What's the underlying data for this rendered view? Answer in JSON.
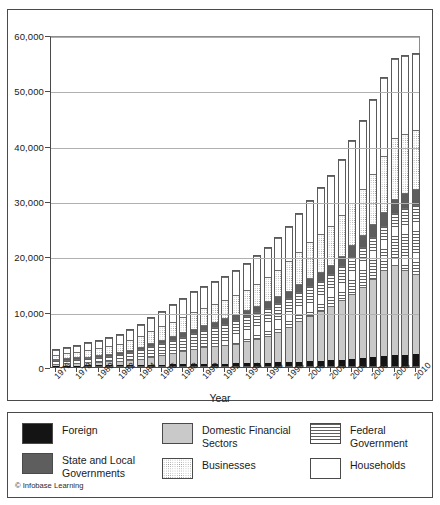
{
  "figure": {
    "credit": "© Infobase Learning"
  },
  "chart_data": {
    "type": "bar",
    "subtype": "stacked",
    "title": "",
    "xlabel": "Year",
    "ylabel": "",
    "ylim": [
      0,
      60000
    ],
    "yticks": [
      0,
      10000,
      20000,
      30000,
      40000,
      50000,
      60000
    ],
    "ytick_labels": [
      "0",
      "10,000",
      "20,000",
      "30,000",
      "40,000",
      "50,000",
      "60,000"
    ],
    "grid": true,
    "legend_position": "below",
    "categories": [
      1976,
      1977,
      1978,
      1979,
      1980,
      1981,
      1982,
      1983,
      1984,
      1985,
      1986,
      1987,
      1988,
      1989,
      1990,
      1991,
      1992,
      1993,
      1994,
      1995,
      1996,
      1997,
      1998,
      1999,
      2000,
      2001,
      2002,
      2003,
      2004,
      2005,
      2006,
      2007,
      2008,
      2009,
      2010
    ],
    "xtick_labels": [
      "1976",
      "1978",
      "1980",
      "1982",
      "1984",
      "1986",
      "1988",
      "1990",
      "1992",
      "1994",
      "1996",
      "1998",
      "2000",
      "2002",
      "2004",
      "2006",
      "2008",
      "2010"
    ],
    "stack_order_bottom_to_top": [
      "Foreign",
      "Domestic Financial Sectors",
      "Federal Government",
      "State and Local Governments",
      "Businesses",
      "Households"
    ],
    "series": [
      {
        "name": "Foreign",
        "fill": "solid-black",
        "color": "#141414",
        "values": [
          60,
          70,
          85,
          95,
          110,
          125,
          140,
          160,
          185,
          215,
          250,
          285,
          320,
          350,
          380,
          405,
          430,
          460,
          500,
          545,
          600,
          665,
          730,
          800,
          880,
          960,
          1050,
          1160,
          1290,
          1430,
          1600,
          1780,
          1940,
          2020,
          2090
        ]
      },
      {
        "name": "Domestic Financial Sectors",
        "fill": "solid-light-gray",
        "color": "#c9c9c9",
        "values": [
          340,
          400,
          470,
          545,
          625,
          710,
          800,
          940,
          1120,
          1380,
          1700,
          2050,
          2400,
          2750,
          3050,
          3200,
          3350,
          3600,
          3950,
          4400,
          4900,
          5550,
          6400,
          7350,
          8250,
          9050,
          9800,
          10700,
          11800,
          12900,
          14200,
          15600,
          16300,
          15400,
          14600
        ]
      },
      {
        "name": "Federal Government",
        "fill": "horizontal-lines",
        "color": "#ffffff",
        "values": [
          620,
          680,
          730,
          780,
          900,
          1000,
          1200,
          1450,
          1700,
          1950,
          2200,
          2400,
          2600,
          2800,
          3050,
          3450,
          3900,
          4250,
          4550,
          4800,
          5000,
          5150,
          5200,
          5250,
          5300,
          5400,
          5700,
          6200,
          6700,
          7100,
          7500,
          7900,
          9400,
          11200,
          12500
        ]
      },
      {
        "name": "State and Local Governments",
        "fill": "solid-dark-gray",
        "color": "#5e5e5e",
        "values": [
          240,
          260,
          280,
          300,
          320,
          340,
          370,
          420,
          480,
          560,
          640,
          700,
          760,
          820,
          880,
          930,
          980,
          1030,
          1080,
          1130,
          1190,
          1250,
          1320,
          1400,
          1480,
          1600,
          1750,
          1900,
          2050,
          2200,
          2350,
          2500,
          2600,
          2700,
          2800
        ]
      },
      {
        "name": "Businesses",
        "fill": "dotted",
        "color": "#ffffff",
        "values": [
          780,
          880,
          1000,
          1130,
          1270,
          1400,
          1520,
          1680,
          1900,
          2150,
          2400,
          2620,
          2850,
          3050,
          3200,
          3250,
          3300,
          3450,
          3700,
          4000,
          4350,
          4750,
          5300,
          5900,
          6500,
          6900,
          7100,
          7300,
          7700,
          8300,
          9100,
          10100,
          10900,
          10700,
          10600
        ]
      },
      {
        "name": "Households",
        "fill": "white",
        "color": "#ffffff",
        "values": [
          880,
          980,
          1100,
          1240,
          1380,
          1500,
          1620,
          1800,
          2050,
          2350,
          2650,
          2950,
          3250,
          3550,
          3800,
          3950,
          4100,
          4350,
          4650,
          5000,
          5350,
          5750,
          6250,
          6850,
          7500,
          8200,
          9000,
          10000,
          11100,
          12300,
          13400,
          14200,
          14300,
          14000,
          13800
        ]
      }
    ],
    "totals": [
      2920,
      3270,
      3665,
      4090,
      4605,
      5075,
      5650,
      6450,
      7435,
      8605,
      9840,
      11005,
      12180,
      13320,
      14360,
      15185,
      16060,
      17140,
      18480,
      19875,
      21390,
      23115,
      25200,
      27550,
      29910,
      32110,
      34400,
      37260,
      40640,
      44230,
      48150,
      52080,
      55440,
      56020,
      56390
    ]
  },
  "legend": {
    "items": [
      {
        "label": "Foreign",
        "swatch": "solid-black-swatch"
      },
      {
        "label": "State and Local\nGovernments",
        "swatch": "solid-dark-gray-swatch"
      },
      {
        "label": "Domestic Financial\nSectors",
        "swatch": "solid-light-gray-swatch"
      },
      {
        "label": "Businesses",
        "swatch": "dotted-swatch"
      },
      {
        "label": "Federal\nGovernment",
        "swatch": "horizontal-lines-swatch"
      },
      {
        "label": "Households",
        "swatch": "white-swatch"
      }
    ]
  }
}
